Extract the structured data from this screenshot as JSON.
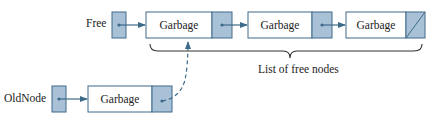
{
  "figure": {
    "caption_remnant": "",
    "colors": {
      "stroke": "#3e6a8a",
      "pointer_fill": "#a9c1d6",
      "node_fill": "#ffffff",
      "text": "#222222",
      "brace": "#333333"
    }
  },
  "free": {
    "label": "Free",
    "nodes": [
      {
        "data": "Garbage",
        "next": "pointer"
      },
      {
        "data": "Garbage",
        "next": "pointer"
      },
      {
        "data": "Garbage",
        "next": "null"
      }
    ]
  },
  "brace_label": "List of free nodes",
  "oldnode": {
    "label": "OldNode",
    "node": {
      "data": "Garbage",
      "next": "dashed-pointer-to-free-list-head"
    }
  }
}
